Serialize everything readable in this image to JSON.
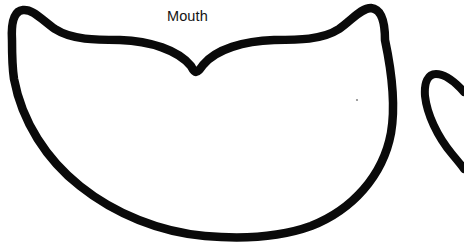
{
  "document": {
    "kind": "line-drawing",
    "subject": "Mouth",
    "background_color": "#ffffff",
    "ink_color": "#0a0a0a"
  },
  "labels": {
    "mouth": "Mouth"
  },
  "shapes": {
    "main_mouth": {
      "name": "mouth-outline",
      "stroke_color": "#0a0a0a",
      "stroke_width": 8.5,
      "fill": "none",
      "path": "M 12 40 C 11 22 14 11 23 10 C 33 9 42 20 55 29 C 72 40 96 40 120 40 C 150 41 178 50 191 66 C 193 70 195 72 196 72 C 198 72 200 69 203 65 C 216 49 244 41 274 40 C 298 40 322 40 339 29 C 352 20 361 8 371 8 C 381 9 385 21 385 40 C 392 73 396 104 391 133 C 383 176 352 210 311 226 C 278 238 240 239 205 236 C 160 232 115 214 80 186 C 47 160 22 122 14 79 C 12 66 12 52 12 40 Z"
    },
    "secondary_mouth": {
      "name": "mouth-outline-partial",
      "stroke_color": "#0a0a0a",
      "stroke_width": 8,
      "fill": "none",
      "clipped_edge": "right",
      "path": "M 425 96 C 424 82 428 74 436 74 C 446 74 456 83 464 92 M 425 96 C 427 114 437 136 452 154 C 457 160 462 166 464 169"
    },
    "speck": {
      "name": "speck-artifact",
      "cx": 357,
      "cy": 100,
      "r": 1.1,
      "color": "#8a8a8a"
    }
  },
  "canvas": {
    "width": 464,
    "height": 247
  }
}
